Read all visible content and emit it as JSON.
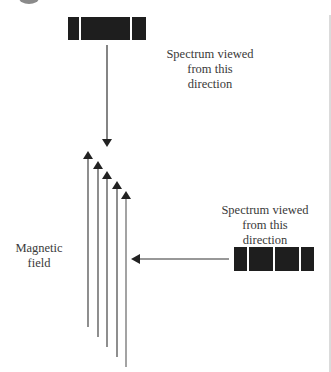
{
  "diagram": {
    "top_view_label": {
      "lines": [
        "Spectrum viewed",
        "from this",
        "direction"
      ]
    },
    "side_view_label": {
      "lines": [
        "Spectrum viewed",
        "from this",
        "direction"
      ]
    },
    "field_label": {
      "lines": [
        "Magnetic",
        "field"
      ]
    },
    "top_spectrum": {
      "segments": 3,
      "orientation": "horizontal"
    },
    "side_spectrum": {
      "segments": 4,
      "orientation": "horizontal"
    },
    "magnetic_field_arrows": {
      "count": 5,
      "direction": "up"
    },
    "colors": {
      "line": "#333333",
      "spectrum_fill": "#1e1e1e",
      "border": "#cccccc",
      "circle": "#999999"
    }
  }
}
